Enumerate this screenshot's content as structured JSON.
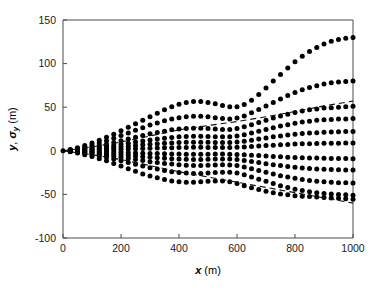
{
  "figure": {
    "background": "#ffffff",
    "marker_color": "#000000",
    "axis_color": "#4a4a4a"
  },
  "chart_data": {
    "type": "scatter",
    "title": "",
    "subtitle": "",
    "xlabel": "x (m)",
    "ylabel": "y, σy (m)",
    "xlabel_symbol": "x",
    "xlabel_unit": "(m)",
    "ylabel_symbol_1": "y",
    "ylabel_symbol_2": "σ",
    "ylabel_subscript": "y",
    "ylabel_unit": "(m)",
    "xlim": [
      0,
      1000
    ],
    "ylim": [
      -100,
      150
    ],
    "xticks": [
      0,
      200,
      400,
      600,
      800,
      1000
    ],
    "yticks": [
      -100,
      -50,
      0,
      50,
      100,
      150
    ],
    "xticklabels": [
      "0",
      "200",
      "400",
      "600",
      "800",
      "1000"
    ],
    "yticklabels": [
      "-100",
      "-50",
      "0",
      "50",
      "100",
      "150"
    ],
    "grid": false,
    "legend": "none",
    "marker": "filled-circle",
    "x_sample_step": 25,
    "series": [
      {
        "name": "trajectory-1",
        "style": "dotted",
        "x": [
          0,
          25,
          50,
          75,
          100,
          125,
          150,
          175,
          200,
          225,
          250,
          275,
          300,
          325,
          350,
          375,
          400,
          425,
          450,
          475,
          500,
          525,
          550,
          575,
          600,
          625,
          650,
          675,
          700,
          725,
          750,
          775,
          800,
          825,
          850,
          875,
          900,
          925,
          950,
          975,
          1000
        ],
        "y": [
          0,
          1.5,
          3.5,
          6.0,
          9.0,
          12.0,
          15.5,
          19.0,
          23.0,
          27.0,
          31.0,
          35.0,
          39.0,
          43.0,
          47.0,
          50.5,
          53.5,
          55.5,
          56.5,
          56.5,
          55.5,
          54.0,
          52.0,
          50.5,
          50.5,
          53.0,
          58.0,
          64.5,
          72.0,
          80.0,
          87.5,
          95.0,
          102.0,
          108.5,
          114.0,
          118.5,
          122.5,
          125.5,
          127.5,
          129.0,
          130.0
        ]
      },
      {
        "name": "trajectory-2",
        "style": "dotted",
        "x": [
          0,
          25,
          50,
          75,
          100,
          125,
          150,
          175,
          200,
          225,
          250,
          275,
          300,
          325,
          350,
          375,
          400,
          425,
          450,
          475,
          500,
          525,
          550,
          575,
          600,
          625,
          650,
          675,
          700,
          725,
          750,
          775,
          800,
          825,
          850,
          875,
          900,
          925,
          950,
          975,
          1000
        ],
        "y": [
          0,
          1.0,
          2.5,
          4.5,
          6.5,
          9.0,
          11.5,
          14.5,
          17.5,
          20.5,
          23.5,
          26.5,
          29.5,
          32.0,
          34.5,
          36.5,
          38.0,
          39.0,
          39.5,
          39.5,
          39.0,
          38.0,
          37.0,
          36.5,
          37.5,
          40.0,
          43.5,
          47.5,
          51.5,
          55.5,
          59.5,
          63.5,
          67.0,
          70.0,
          72.5,
          74.5,
          76.5,
          78.0,
          79.0,
          79.5,
          80.0
        ]
      },
      {
        "name": "trajectory-3",
        "style": "dotted",
        "x": [
          0,
          25,
          50,
          75,
          100,
          125,
          150,
          175,
          200,
          225,
          250,
          275,
          300,
          325,
          350,
          375,
          400,
          425,
          450,
          475,
          500,
          525,
          550,
          575,
          600,
          625,
          650,
          675,
          700,
          725,
          750,
          775,
          800,
          825,
          850,
          875,
          900,
          925,
          950,
          975,
          1000
        ],
        "y": [
          0,
          0.8,
          1.8,
          3.0,
          4.5,
          6.0,
          7.5,
          9.5,
          11.5,
          13.5,
          15.5,
          17.5,
          19.5,
          21.0,
          22.5,
          24.0,
          25.0,
          25.5,
          26.0,
          26.0,
          25.5,
          25.0,
          24.5,
          24.5,
          25.5,
          27.5,
          30.0,
          32.5,
          35.0,
          37.5,
          40.0,
          42.0,
          44.0,
          45.5,
          47.0,
          48.0,
          49.0,
          49.5,
          50.0,
          50.5,
          51.0
        ]
      },
      {
        "name": "trajectory-4",
        "style": "dotted",
        "x": [
          0,
          25,
          50,
          75,
          100,
          125,
          150,
          175,
          200,
          225,
          250,
          275,
          300,
          325,
          350,
          375,
          400,
          425,
          450,
          475,
          500,
          525,
          550,
          575,
          600,
          625,
          650,
          675,
          700,
          725,
          750,
          775,
          800,
          825,
          850,
          875,
          900,
          925,
          950,
          975,
          1000
        ],
        "y": [
          0,
          0.5,
          1.2,
          2.0,
          3.0,
          4.0,
          5.0,
          6.2,
          7.5,
          8.8,
          10.0,
          11.2,
          12.5,
          13.5,
          14.5,
          15.2,
          16.0,
          16.5,
          16.8,
          16.8,
          16.5,
          16.2,
          16.0,
          16.2,
          17.0,
          18.5,
          20.5,
          22.5,
          24.5,
          26.5,
          28.5,
          30.0,
          31.5,
          33.0,
          34.0,
          35.0,
          35.5,
          36.0,
          36.5,
          36.5,
          37.0
        ]
      },
      {
        "name": "trajectory-5",
        "style": "dotted",
        "x": [
          0,
          25,
          50,
          75,
          100,
          125,
          150,
          175,
          200,
          225,
          250,
          275,
          300,
          325,
          350,
          375,
          400,
          425,
          450,
          475,
          500,
          525,
          550,
          575,
          600,
          625,
          650,
          675,
          700,
          725,
          750,
          775,
          800,
          825,
          850,
          875,
          900,
          925,
          950,
          975,
          1000
        ],
        "y": [
          0,
          0.3,
          0.7,
          1.2,
          1.8,
          2.4,
          3.0,
          3.8,
          4.5,
          5.3,
          6.0,
          6.8,
          7.5,
          8.0,
          8.6,
          9.0,
          9.4,
          9.7,
          9.9,
          9.9,
          9.7,
          9.5,
          9.4,
          9.5,
          10.0,
          11.0,
          12.2,
          13.5,
          14.8,
          16.0,
          17.0,
          18.0,
          19.0,
          19.7,
          20.3,
          20.8,
          21.2,
          21.5,
          21.8,
          22.0,
          22.0
        ]
      },
      {
        "name": "trajectory-6",
        "style": "dotted",
        "x": [
          0,
          25,
          50,
          75,
          100,
          125,
          150,
          175,
          200,
          225,
          250,
          275,
          300,
          325,
          350,
          375,
          400,
          425,
          450,
          475,
          500,
          525,
          550,
          575,
          600,
          625,
          650,
          675,
          700,
          725,
          750,
          775,
          800,
          825,
          850,
          875,
          900,
          925,
          950,
          975,
          1000
        ],
        "y": [
          0,
          0.1,
          0.3,
          0.5,
          0.7,
          1.0,
          1.2,
          1.5,
          1.8,
          2.1,
          2.4,
          2.7,
          3.0,
          3.2,
          3.4,
          3.6,
          3.8,
          3.9,
          4.0,
          4.0,
          3.9,
          3.8,
          3.8,
          3.9,
          4.1,
          4.5,
          5.0,
          5.5,
          6.0,
          6.5,
          6.9,
          7.3,
          7.7,
          8.0,
          8.2,
          8.4,
          8.6,
          8.7,
          8.8,
          8.9,
          9.0
        ]
      },
      {
        "name": "trajectory-7",
        "style": "dotted",
        "x": [
          0,
          25,
          50,
          75,
          100,
          125,
          150,
          175,
          200,
          225,
          250,
          275,
          300,
          325,
          350,
          375,
          400,
          425,
          450,
          475,
          500,
          525,
          550,
          575,
          600,
          625,
          650,
          675,
          700,
          725,
          750,
          775,
          800,
          825,
          850,
          875,
          900,
          925,
          950,
          975,
          1000
        ],
        "y": [
          0,
          -0.1,
          -0.3,
          -0.5,
          -0.7,
          -1.0,
          -1.2,
          -1.5,
          -1.8,
          -2.1,
          -2.4,
          -2.7,
          -3.0,
          -3.2,
          -3.4,
          -3.6,
          -3.8,
          -3.9,
          -4.0,
          -4.0,
          -3.9,
          -3.8,
          -3.8,
          -3.9,
          -4.1,
          -4.5,
          -5.0,
          -5.5,
          -6.0,
          -6.5,
          -6.9,
          -7.3,
          -7.7,
          -8.0,
          -8.2,
          -8.4,
          -8.6,
          -8.7,
          -8.8,
          -8.9,
          -9.0
        ]
      },
      {
        "name": "trajectory-8",
        "style": "dotted",
        "x": [
          0,
          25,
          50,
          75,
          100,
          125,
          150,
          175,
          200,
          225,
          250,
          275,
          300,
          325,
          350,
          375,
          400,
          425,
          450,
          475,
          500,
          525,
          550,
          575,
          600,
          625,
          650,
          675,
          700,
          725,
          750,
          775,
          800,
          825,
          850,
          875,
          900,
          925,
          950,
          975,
          1000
        ],
        "y": [
          0,
          -0.3,
          -0.7,
          -1.2,
          -1.8,
          -2.4,
          -3.0,
          -3.8,
          -4.5,
          -5.3,
          -6.0,
          -6.8,
          -7.5,
          -8.0,
          -8.6,
          -9.0,
          -9.4,
          -9.7,
          -9.9,
          -9.9,
          -9.7,
          -9.5,
          -9.4,
          -9.5,
          -10.0,
          -11.0,
          -12.2,
          -13.5,
          -14.8,
          -16.0,
          -17.0,
          -18.0,
          -19.0,
          -19.7,
          -20.3,
          -20.8,
          -21.2,
          -21.5,
          -21.8,
          -22.0,
          -22.0
        ]
      },
      {
        "name": "trajectory-9",
        "style": "dotted",
        "x": [
          0,
          25,
          50,
          75,
          100,
          125,
          150,
          175,
          200,
          225,
          250,
          275,
          300,
          325,
          350,
          375,
          400,
          425,
          450,
          475,
          500,
          525,
          550,
          575,
          600,
          625,
          650,
          675,
          700,
          725,
          750,
          775,
          800,
          825,
          850,
          875,
          900,
          925,
          950,
          975,
          1000
        ],
        "y": [
          0,
          -0.5,
          -1.2,
          -2.0,
          -3.0,
          -4.0,
          -5.0,
          -6.2,
          -7.5,
          -8.8,
          -10.0,
          -11.2,
          -12.5,
          -13.5,
          -14.5,
          -15.2,
          -16.0,
          -16.5,
          -16.8,
          -16.8,
          -16.5,
          -16.2,
          -16.0,
          -16.2,
          -17.0,
          -18.5,
          -20.5,
          -22.5,
          -24.5,
          -26.5,
          -28.5,
          -30.0,
          -31.5,
          -33.0,
          -34.0,
          -35.0,
          -35.5,
          -36.0,
          -36.5,
          -36.5,
          -37.0
        ]
      },
      {
        "name": "trajectory-10",
        "style": "dotted",
        "x": [
          0,
          25,
          50,
          75,
          100,
          125,
          150,
          175,
          200,
          225,
          250,
          275,
          300,
          325,
          350,
          375,
          400,
          425,
          450,
          475,
          500,
          525,
          550,
          575,
          600,
          625,
          650,
          675,
          700,
          725,
          750,
          775,
          800,
          825,
          850,
          875,
          900,
          925,
          950,
          975,
          1000
        ],
        "y": [
          0,
          -0.8,
          -1.8,
          -3.0,
          -4.5,
          -6.0,
          -7.5,
          -9.5,
          -11.5,
          -13.5,
          -15.5,
          -17.5,
          -19.5,
          -21.0,
          -22.5,
          -24.0,
          -25.0,
          -25.5,
          -26.0,
          -26.0,
          -25.5,
          -25.0,
          -24.5,
          -24.5,
          -25.5,
          -27.5,
          -30.0,
          -32.5,
          -35.0,
          -37.5,
          -40.0,
          -42.0,
          -44.0,
          -45.5,
          -47.0,
          -48.0,
          -49.0,
          -49.5,
          -50.0,
          -50.5,
          -51.0
        ]
      },
      {
        "name": "trajectory-11",
        "style": "dotted",
        "x": [
          0,
          25,
          50,
          75,
          100,
          125,
          150,
          175,
          200,
          225,
          250,
          275,
          300,
          325,
          350,
          375,
          400,
          425,
          450,
          475,
          500,
          525,
          550,
          575,
          600,
          625,
          650,
          675,
          700,
          725,
          750,
          775,
          800,
          825,
          850,
          875,
          900,
          925,
          950,
          975,
          1000
        ],
        "y": [
          0,
          -1.0,
          -2.5,
          -4.5,
          -6.5,
          -9.0,
          -11.5,
          -14.5,
          -17.5,
          -20.5,
          -23.5,
          -26.5,
          -29.0,
          -31.0,
          -33.0,
          -34.5,
          -35.5,
          -36.0,
          -36.0,
          -35.5,
          -35.0,
          -34.5,
          -34.5,
          -35.5,
          -37.5,
          -40.0,
          -42.5,
          -44.5,
          -46.5,
          -48.0,
          -49.5,
          -50.5,
          -51.5,
          -52.0,
          -52.5,
          -53.0,
          -53.5,
          -54.0,
          -54.5,
          -55.0,
          -55.5
        ]
      },
      {
        "name": "sigma-y-upper",
        "style": "dashed",
        "x": [
          0,
          100,
          200,
          300,
          400,
          500,
          600,
          700,
          800,
          900,
          1000
        ],
        "y": [
          0,
          4.5,
          10.0,
          17.0,
          24.0,
          29.0,
          33.5,
          39.0,
          45.0,
          51.5,
          57.0
        ]
      },
      {
        "name": "sigma-y-lower",
        "style": "dashed",
        "x": [
          0,
          100,
          200,
          300,
          400,
          500,
          600,
          700,
          800,
          900,
          1000
        ],
        "y": [
          0,
          -4.5,
          -10.0,
          -17.0,
          -24.0,
          -30.0,
          -36.0,
          -42.0,
          -48.0,
          -54.0,
          -60.0
        ]
      }
    ]
  }
}
